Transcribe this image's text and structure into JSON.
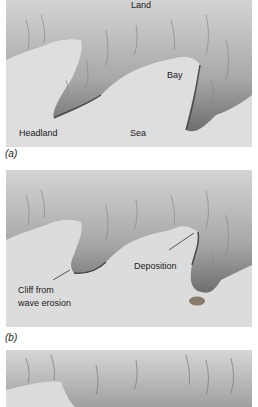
{
  "figure": {
    "panels": [
      {
        "id": "a",
        "caption": "(a)",
        "labels": {
          "land": "Land",
          "bay": "Bay",
          "headland": "Headland",
          "sea": "Sea"
        }
      },
      {
        "id": "b",
        "caption": "(b)",
        "labels": {
          "deposition": "Deposition",
          "cliff_line1": "Cliff from",
          "cliff_line2": "wave erosion"
        }
      },
      {
        "id": "c",
        "caption": ""
      }
    ],
    "colors": {
      "sea": "#dcdcdc",
      "land_light": "#c8c8c8",
      "land_dark": "#5a5a5a",
      "background": "#ffffff"
    }
  }
}
